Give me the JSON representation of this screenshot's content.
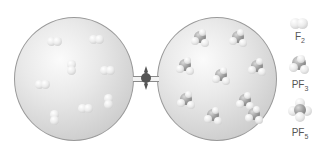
{
  "figure": {
    "left_flask": {
      "contents": "F2",
      "molecule_count": 8
    },
    "right_flask": {
      "contents": "PF3",
      "molecule_count": 9
    },
    "valve": {
      "state": "closed"
    }
  },
  "legend": {
    "items": [
      {
        "formula": "F",
        "subscript": "2",
        "icon": "f2-molecule-icon"
      },
      {
        "formula": "PF",
        "subscript": "3",
        "icon": "pf3-molecule-icon"
      },
      {
        "formula": "PF",
        "subscript": "5",
        "icon": "pf5-molecule-icon"
      }
    ]
  },
  "colors": {
    "fluorine_atom": "#ececec",
    "phosphorus_atom": "#9a9a9a",
    "flask_outline": "#9a9a9a"
  }
}
